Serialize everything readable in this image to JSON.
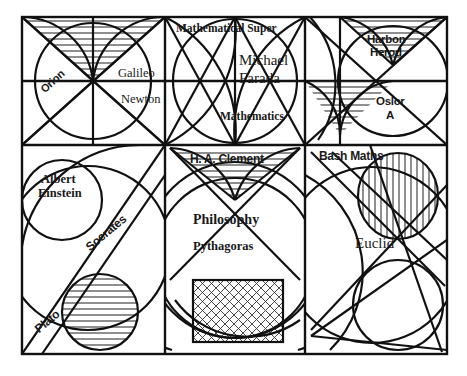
{
  "figure": {
    "kind": "geometric-panel-diagram",
    "stroke_color": "#111111",
    "hatch_color": "#333333",
    "background": "#ffffff",
    "frame": {
      "x": 22,
      "y": 17,
      "width": 425,
      "height": 337
    }
  },
  "labels": {
    "orion": "Orion",
    "galileo": "Galileo",
    "newton": "Newton",
    "mathematical_super": "Mathematical Super",
    "michael": "Michael",
    "farada": "Farada",
    "mathematics": "Mathematics",
    "harbon": "Harbon",
    "herod": "Herod",
    "oslor": "Oslor",
    "oslor_a": "A",
    "albert": "Albert",
    "einstein": "Einstein",
    "socrates": "Socrates",
    "plato": "Plato",
    "ha_clement": "H. A. Clement",
    "philosophy": "Philosophy",
    "pythagoras": "Pythagoras",
    "bash_maths": "Bash Maths",
    "euclid": "Euclid"
  }
}
